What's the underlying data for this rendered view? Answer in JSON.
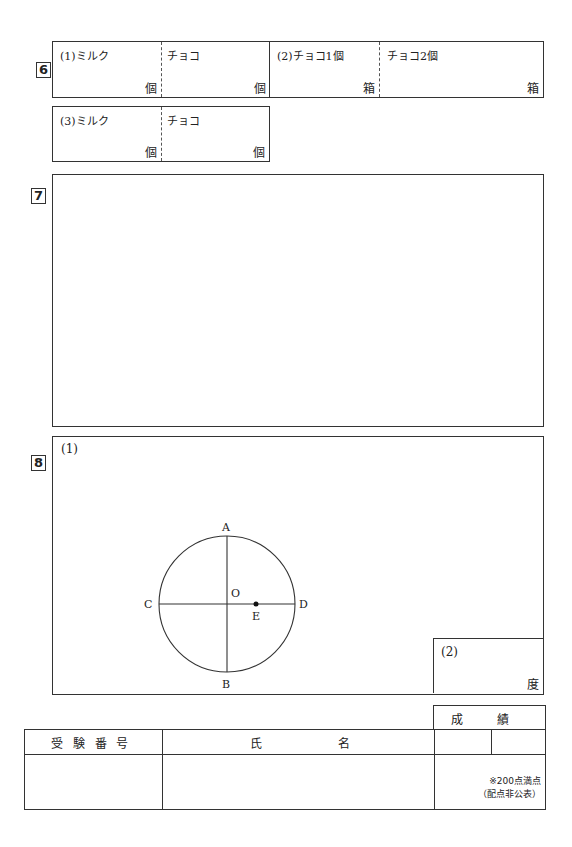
{
  "q6": {
    "number": "6",
    "row1": {
      "cells": [
        {
          "label": "(1)ミルク",
          "unit": "個"
        },
        {
          "label": "チョコ",
          "unit": "個"
        },
        {
          "label": "(2)チョコ1個",
          "unit": "箱"
        },
        {
          "label": "チョコ2個",
          "unit": "箱"
        }
      ]
    },
    "row2": {
      "cells": [
        {
          "label": "(3)ミルク",
          "unit": "個"
        },
        {
          "label": "チョコ",
          "unit": "個"
        }
      ]
    }
  },
  "q7": {
    "number": "7"
  },
  "q8": {
    "number": "8",
    "part1_label": "(1)",
    "part2_label": "(2)",
    "part2_unit": "度",
    "figure": {
      "points": {
        "A": "A",
        "B": "B",
        "C": "C",
        "D": "D",
        "O": "O",
        "E": "E"
      }
    }
  },
  "footer": {
    "exam_number_header": "受 験 番 号",
    "name_header_1": "氏",
    "name_header_2": "名",
    "score_header_1": "成",
    "score_header_2": "績",
    "score_note_1": "※200点満点",
    "score_note_2": "（配点非公表）"
  }
}
